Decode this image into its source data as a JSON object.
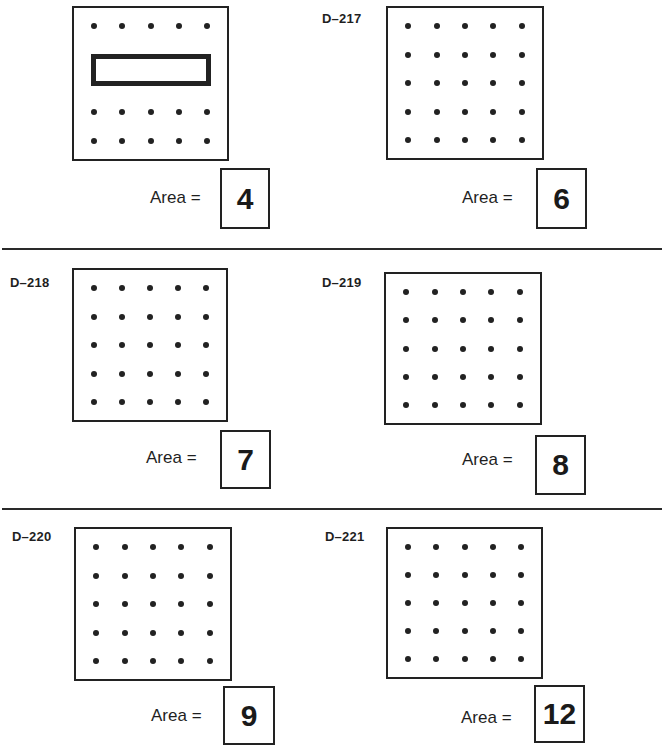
{
  "worksheet": {
    "area_label": "Area =",
    "grid": {
      "rows": 5,
      "cols": 5
    },
    "problems": [
      {
        "id": "",
        "label": "",
        "answer": "4",
        "shape": {
          "type": "rectangle",
          "from_col": 1,
          "to_col": 5,
          "from_row": 2,
          "to_row": 3,
          "dots_hidden_rows": [
            2,
            3
          ]
        }
      },
      {
        "id": "D-217",
        "label": "D–217",
        "answer": "6",
        "shape": null
      },
      {
        "id": "D-218",
        "label": "D–218",
        "answer": "7",
        "shape": null
      },
      {
        "id": "D-219",
        "label": "D–219",
        "answer": "8",
        "shape": null
      },
      {
        "id": "D-220",
        "label": "D–220",
        "answer": "9",
        "shape": null
      },
      {
        "id": "D-221",
        "label": "D–221",
        "answer": "12",
        "shape": null
      }
    ]
  },
  "colors": {
    "ink": "#222222",
    "paper": "#ffffff"
  }
}
